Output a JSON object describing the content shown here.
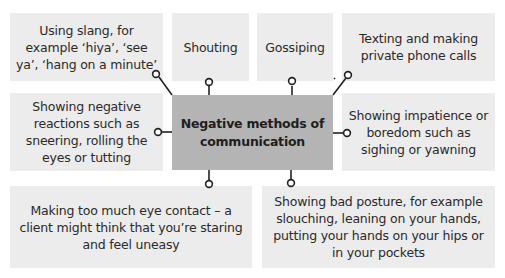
{
  "diagram": {
    "center": {
      "label": "Negative methods of communication"
    },
    "boxes": [
      {
        "id": "slang",
        "label": "Using slang, for example ‘hiya’, ‘see ya’, ‘hang on a minute’"
      },
      {
        "id": "shouting",
        "label": "Shouting"
      },
      {
        "id": "gossiping",
        "label": "Gossiping"
      },
      {
        "id": "texting",
        "label": "Texting and making private phone calls"
      },
      {
        "id": "negative-reactions",
        "label": "Showing negative reactions such as sneering, rolling the eyes or tutting"
      },
      {
        "id": "impatience",
        "label": "Showing impatience or boredom such as sighing or yawning"
      },
      {
        "id": "eye-contact",
        "label": "Making too much eye contact – a client might think that you’re staring and feel uneasy"
      },
      {
        "id": "posture",
        "label": "Showing bad posture, for example slouching, leaning on your hands, putting your hands on your hips or in your pockets"
      }
    ],
    "colors": {
      "box_fill": "#ececec",
      "center_fill": "#b4b4b4",
      "connector": "#222222",
      "text": "#2a2a2a"
    }
  }
}
